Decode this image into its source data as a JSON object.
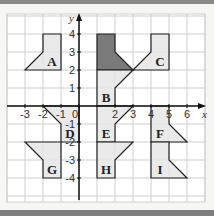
{
  "diagram": {
    "axes": {
      "x_label": "x",
      "y_label": "y",
      "x_ticks": [
        "-3",
        "-2",
        "-1",
        "0",
        "2",
        "3",
        "4",
        "5",
        "6"
      ],
      "y_ticks": [
        "4",
        "3",
        "2",
        "1",
        "-1",
        "-2",
        "-3",
        "-4"
      ],
      "x_range": [
        -4,
        7
      ],
      "y_range": [
        -5,
        5
      ]
    },
    "colors": {
      "grid": "#cfcfcf",
      "axis": "#111111",
      "shape_fill": "#e6e6e6",
      "object_fill": "#7a7a7a",
      "outline": "#222222"
    },
    "object": {
      "name": "object",
      "points": [
        [
          1,
          4
        ],
        [
          2,
          4
        ],
        [
          2,
          3
        ],
        [
          3,
          2
        ],
        [
          1,
          2
        ]
      ]
    },
    "shapes": [
      {
        "label": "A",
        "points": [
          [
            -2,
            4
          ],
          [
            -1,
            4
          ],
          [
            -1,
            2
          ],
          [
            -3,
            2
          ],
          [
            -2,
            3
          ]
        ],
        "label_pos": [
          -1.5,
          2.5
        ]
      },
      {
        "label": "B",
        "points": [
          [
            1,
            2
          ],
          [
            3,
            2
          ],
          [
            2,
            1
          ],
          [
            2,
            0
          ],
          [
            1,
            0
          ]
        ],
        "label_pos": [
          1.5,
          0.5
        ]
      },
      {
        "label": "C",
        "points": [
          [
            4,
            4
          ],
          [
            5,
            4
          ],
          [
            5,
            2
          ],
          [
            3,
            2
          ],
          [
            4,
            3
          ]
        ],
        "label_pos": [
          4.5,
          2.5
        ]
      },
      {
        "label": "D",
        "points": [
          [
            -2,
            0
          ],
          [
            0,
            0
          ],
          [
            0,
            -2
          ],
          [
            -1,
            -2
          ],
          [
            -1,
            -1
          ]
        ],
        "label_pos": [
          -0.5,
          -1.5
        ]
      },
      {
        "label": "E",
        "points": [
          [
            1,
            0
          ],
          [
            3,
            0
          ],
          [
            2,
            -1
          ],
          [
            2,
            -2
          ],
          [
            1,
            -2
          ]
        ],
        "label_pos": [
          1.5,
          -1.5
        ]
      },
      {
        "label": "F",
        "points": [
          [
            4,
            0
          ],
          [
            5,
            0
          ],
          [
            5,
            -1
          ],
          [
            6,
            -2
          ],
          [
            4,
            -2
          ]
        ],
        "label_pos": [
          4.5,
          -1.5
        ]
      },
      {
        "label": "G",
        "points": [
          [
            -3,
            -2
          ],
          [
            -1,
            -2
          ],
          [
            -1,
            -4
          ],
          [
            -2,
            -4
          ],
          [
            -2,
            -3
          ]
        ],
        "label_pos": [
          -1.5,
          -3.5
        ]
      },
      {
        "label": "H",
        "points": [
          [
            1,
            -2
          ],
          [
            3,
            -2
          ],
          [
            2,
            -3
          ],
          [
            2,
            -4
          ],
          [
            1,
            -4
          ]
        ],
        "label_pos": [
          1.5,
          -3.5
        ]
      },
      {
        "label": "I",
        "points": [
          [
            4,
            -2
          ],
          [
            5,
            -2
          ],
          [
            5,
            -3
          ],
          [
            6,
            -4
          ],
          [
            4,
            -4
          ]
        ],
        "label_pos": [
          4.5,
          -3.5
        ]
      }
    ]
  }
}
